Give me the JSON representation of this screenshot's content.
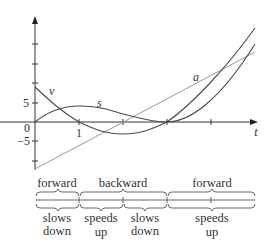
{
  "figure": {
    "axes": {
      "x_label": "t",
      "tick_labels": {
        "origin": "0",
        "x_one": "1",
        "y_five": "5",
        "y_neg_five": "−5"
      }
    },
    "curves": {
      "position": {
        "label": "s",
        "formula_note": "s = t^3 - 6t^2 + 9t"
      },
      "velocity": {
        "label": "v",
        "formula_note": "v = 3t^2 - 12t + 9"
      },
      "acceleration": {
        "label": "a",
        "formula_note": "a = 6t - 12"
      }
    },
    "direction_row": {
      "segments": [
        {
          "label": "forward",
          "from_t": 0,
          "to_t": 1
        },
        {
          "label": "backward",
          "from_t": 1,
          "to_t": 3
        },
        {
          "label": "forward",
          "from_t": 3,
          "to_t": 5
        }
      ]
    },
    "speed_row": {
      "segments": [
        {
          "line1": "slows",
          "line2": "down",
          "from_t": 0,
          "to_t": 1
        },
        {
          "line1": "speeds",
          "line2": "up",
          "from_t": 1,
          "to_t": 2
        },
        {
          "line1": "slows",
          "line2": "down",
          "from_t": 2,
          "to_t": 3
        },
        {
          "line1": "speeds",
          "line2": "up",
          "from_t": 3,
          "to_t": 5
        }
      ]
    },
    "colors": {
      "curve": "#4a4a4a",
      "accel_line": "#9a9a9a",
      "axis": "#333333",
      "text": "#333333"
    }
  }
}
